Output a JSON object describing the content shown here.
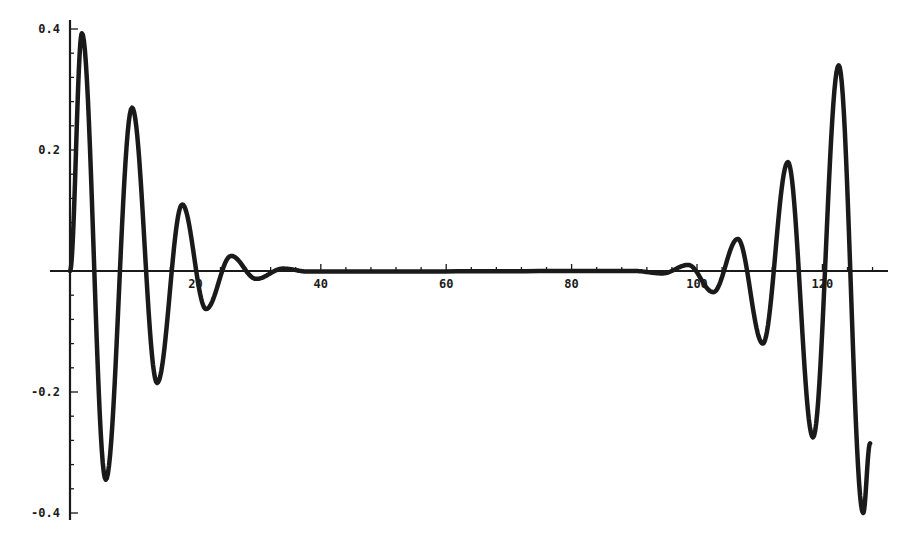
{
  "chart_data": {
    "type": "line",
    "title": "",
    "xlabel": "",
    "ylabel": "",
    "xlim": [
      -3,
      130
    ],
    "ylim": [
      -0.42,
      0.42
    ],
    "grid": false,
    "legend": null,
    "x_ticks": [
      20,
      40,
      60,
      80,
      100,
      120
    ],
    "x_tick_labels": [
      "20",
      "40",
      "60",
      "80",
      "100",
      "120"
    ],
    "y_ticks": [
      0.4,
      0.2,
      -0.2,
      -0.4
    ],
    "y_tick_labels": [
      "0.4",
      "0.2",
      "-0.2",
      "-0.4"
    ],
    "series": [
      {
        "name": "signal",
        "color": "#1a1a1a",
        "description": "Damped oscillation decaying from t=0, near zero from ~35 to ~95, then growing oscillation toward t=128",
        "extrema": [
          {
            "x": 0,
            "y": 0.0
          },
          {
            "x": 1.9,
            "y": 0.393
          },
          {
            "x": 5.7,
            "y": -0.345
          },
          {
            "x": 9.9,
            "y": 0.27
          },
          {
            "x": 13.9,
            "y": -0.185
          },
          {
            "x": 17.9,
            "y": 0.11
          },
          {
            "x": 21.7,
            "y": -0.063
          },
          {
            "x": 25.7,
            "y": 0.025
          },
          {
            "x": 29.7,
            "y": -0.013
          },
          {
            "x": 34.0,
            "y": 0.004
          },
          {
            "x": 38.0,
            "y": -0.001
          },
          {
            "x": 90.0,
            "y": 0.0
          },
          {
            "x": 94.5,
            "y": -0.004
          },
          {
            "x": 98.6,
            "y": 0.01
          },
          {
            "x": 102.6,
            "y": -0.035
          },
          {
            "x": 106.5,
            "y": 0.053
          },
          {
            "x": 110.5,
            "y": -0.12
          },
          {
            "x": 114.5,
            "y": 0.18
          },
          {
            "x": 118.5,
            "y": -0.275
          },
          {
            "x": 122.6,
            "y": 0.34
          },
          {
            "x": 126.5,
            "y": -0.4
          },
          {
            "x": 127.6,
            "y": -0.285
          }
        ]
      }
    ]
  }
}
